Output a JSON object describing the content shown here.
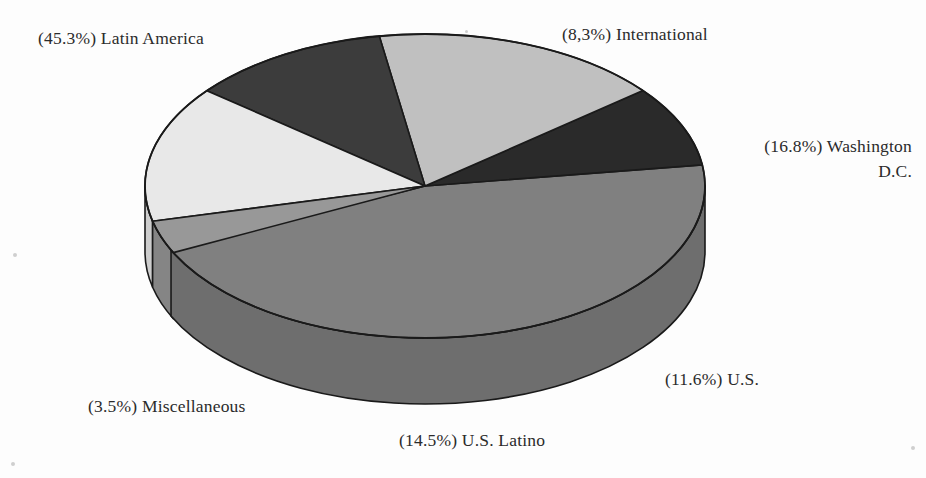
{
  "chart_data": {
    "type": "pie",
    "title": "",
    "subtitle": "",
    "xlabel": "",
    "ylabel": "",
    "grid": false,
    "legend_position": "none",
    "style": "3d-perspective-pie-grayscale",
    "label_format": "(value%) name",
    "total_percent": 100.0,
    "categories": [
      "Latin America",
      "International",
      "Washington D.C.",
      "U.S.",
      "U.S. Latino",
      "Miscellaneous"
    ],
    "values": [
      45.3,
      8.3,
      16.8,
      11.6,
      14.5,
      3.5
    ],
    "slices": [
      {
        "name": "Latin America",
        "value": 45.3,
        "percent_text": "45.3%",
        "label": "(45.3%) Latin America",
        "color": "#808080",
        "side_color": "#6e6e6e",
        "start_angle": 352.0,
        "end_angle": 515.1
      },
      {
        "name": "International",
        "value": 8.3,
        "percent_text": "8,3%",
        "label": "(8,3%) International",
        "color": "#2a2a2a",
        "side_color": "#202020",
        "start_angle": 352.0,
        "end_angle": 321.1
      },
      {
        "name": "Washington D.C.",
        "value": 16.8,
        "percent_text": "16.8%",
        "label_line1": "(16.8%) Washington",
        "label_line2": "D.C.",
        "label": "(16.8%) Washington D.C.",
        "color": "#c0c0c0",
        "side_color": "#a9a9a9",
        "start_angle": 321.1,
        "end_angle": 260.6
      },
      {
        "name": "U.S.",
        "value": 11.6,
        "percent_text": "11.6%",
        "label": "(11.6%) U.S.",
        "color": "#3c3c3c",
        "side_color": "#2e2e2e",
        "start_angle": 260.6,
        "end_angle": 218.8
      },
      {
        "name": "U.S. Latino",
        "value": 14.5,
        "percent_text": "14.5%",
        "label": "(14.5%) U.S. Latino",
        "color": "#e8e8e8",
        "side_color": "#cdcdcd",
        "start_angle": 218.8,
        "end_angle": 166.6
      },
      {
        "name": "Miscellaneous",
        "value": 3.5,
        "percent_text": "3.5%",
        "label": "(3.5%) Miscellaneous",
        "color": "#989898",
        "side_color": "#858585",
        "start_angle": 166.6,
        "end_angle": 154.0
      }
    ],
    "colors": {
      "latin_america": "#808080",
      "international": "#2a2a2a",
      "washington_dc": "#c0c0c0",
      "us": "#3c3c3c",
      "us_latino": "#e8e8e8",
      "miscellaneous": "#989898",
      "outline": "#1a1a1a",
      "background": "#fdfdfd",
      "label_text": "#2b2b2b"
    },
    "geometry": {
      "center_x": 425,
      "center_y": 186,
      "radius_x": 280,
      "radius_y": 152,
      "depth": 66
    }
  }
}
